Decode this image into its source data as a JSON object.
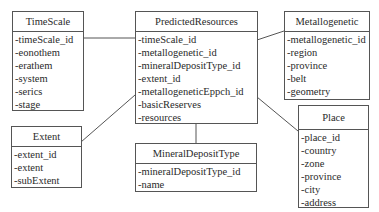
{
  "diagram": {
    "type": "er-diagram",
    "entities": [
      {
        "name": "TimeScale",
        "attributes": [
          "-timeScale_id",
          "-eonothem",
          "-erathem",
          "-system",
          "-serics",
          "-stage"
        ]
      },
      {
        "name": "PredictedResources",
        "attributes": [
          "-timeScale_id",
          "-metallogenetic_id",
          "-mineralDepositType_id",
          "-extent_id",
          "-metallogeneticEppch_id",
          "-basicReserves",
          "-resources"
        ]
      },
      {
        "name": "Metallogenetic",
        "attributes": [
          "-metallogenetic_id",
          "-region",
          "-province",
          "-belt",
          "-geometry"
        ]
      },
      {
        "name": "Extent",
        "attributes": [
          "-extent_id",
          "-extent",
          "-subExtent"
        ]
      },
      {
        "name": "MineralDepositType",
        "attributes": [
          "-mineralDepositType_id",
          "-name"
        ]
      },
      {
        "name": "Place",
        "attributes": [
          "-place_id",
          "-country",
          "-zone",
          "-province",
          "-city",
          "-address"
        ]
      }
    ],
    "relationships": [
      {
        "from": "PredictedResources",
        "to": "TimeScale"
      },
      {
        "from": "PredictedResources",
        "to": "Metallogenetic"
      },
      {
        "from": "PredictedResources",
        "to": "Extent"
      },
      {
        "from": "PredictedResources",
        "to": "MineralDepositType"
      },
      {
        "from": "PredictedResources",
        "to": "Place"
      }
    ],
    "colors": {
      "line": "#555555",
      "text": "#2a2a2a",
      "background": "#ffffff"
    }
  }
}
